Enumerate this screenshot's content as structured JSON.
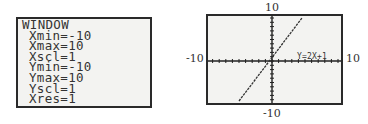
{
  "window_screen": {
    "title": "WINDOW",
    "lines": [
      "Xmin=-10",
      "Xmax=10",
      "Xscl=1",
      "Ymin=-10",
      "Ymax=10",
      "Yscl=1",
      "Xres=1"
    ]
  },
  "graph": {
    "equation_label": "Y=2X+1",
    "axis_labels": {
      "ymax": "10",
      "ymin": "-10",
      "xmin": "-10",
      "xmax": "10"
    }
  },
  "chart_data": {
    "type": "line",
    "title": "",
    "series": [
      {
        "name": "Y=2X+1",
        "x": [
          -5.5,
          4.5
        ],
        "values": [
          -10,
          10
        ]
      }
    ],
    "xlim": [
      -10,
      10
    ],
    "ylim": [
      -10,
      10
    ],
    "xscl": 1,
    "yscl": 1,
    "grid": false
  }
}
